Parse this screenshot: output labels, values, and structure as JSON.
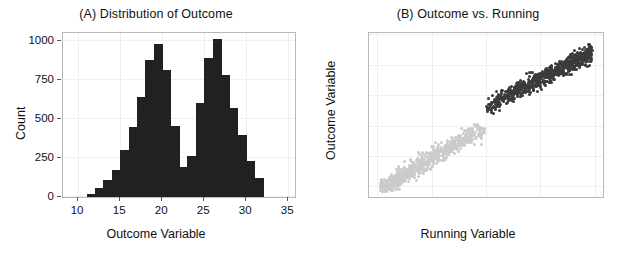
{
  "figure": {
    "background": "#ffffff",
    "width": 625,
    "height": 256
  },
  "panels": {
    "a": {
      "title": "(A) Distribution of Outcome",
      "xlabel": "Outcome Variable",
      "ylabel": "Count"
    },
    "b": {
      "title": "(B) Outcome vs. Running",
      "xlabel": "Running Variable",
      "ylabel": "Outcome Variable"
    }
  },
  "chart_data": [
    {
      "id": "panel-a",
      "type": "bar",
      "title": "(A) Distribution of Outcome",
      "xlabel": "Outcome Variable",
      "ylabel": "Count",
      "xlim": [
        8.2,
        35.8
      ],
      "ylim": [
        0,
        1050
      ],
      "xticks": [
        10,
        15,
        20,
        25,
        30,
        35
      ],
      "yticks": [
        0,
        250,
        500,
        750,
        1000
      ],
      "grid": true,
      "legend": "none",
      "bin_width": 1,
      "bar_color": "#212121",
      "description": "Bimodal histogram of outcome variable with modes near 19 and 25 and a sharp dip near 21-22",
      "bin_centers": [
        11.5,
        12.5,
        13.5,
        14.5,
        15.5,
        16.5,
        17.5,
        18.5,
        19.5,
        20.5,
        21.5,
        22.5,
        23.5,
        24.5,
        25.5,
        26.5,
        27.5,
        28.5,
        29.5,
        30.5,
        31.5
      ],
      "categories": [
        "11-12",
        "12-13",
        "13-14",
        "14-15",
        "15-16",
        "16-17",
        "17-18",
        "18-19",
        "19-20",
        "20-21",
        "21-22",
        "22-23",
        "23-24",
        "24-25",
        "25-26",
        "26-27",
        "27-28",
        "28-29",
        "29-30",
        "30-31",
        "31-32"
      ],
      "values": [
        20,
        60,
        110,
        175,
        300,
        450,
        640,
        880,
        980,
        815,
        455,
        195,
        260,
        600,
        890,
        1010,
        780,
        570,
        400,
        230,
        120
      ]
    },
    {
      "id": "panel-b",
      "type": "scatter",
      "title": "(B) Outcome vs. Running",
      "xlabel": "Running Variable",
      "ylabel": "Outcome Variable",
      "xlim": [
        -21.5,
        21.5
      ],
      "ylim": [
        8.4,
        35.4
      ],
      "xticks": [
        -20,
        -10,
        0,
        10,
        20
      ],
      "yticks": [
        10,
        15,
        20,
        25,
        30,
        35
      ],
      "grid": true,
      "legend": "none",
      "cutoff": 0,
      "discontinuity_jump": 3.0,
      "series": [
        {
          "name": "Below cutoff (control)",
          "color": "#cbcbcb",
          "x_range": [
            -19.5,
            -0.1
          ],
          "y_range": [
            9.2,
            20.4
          ],
          "slope": 0.55,
          "intercept": 20.2,
          "n_points": 700
        },
        {
          "name": "At or above cutoff (treated)",
          "color": "#3b3b3b",
          "x_range": [
            0.1,
            19.5
          ],
          "y_range": [
            19.8,
            33.7
          ],
          "slope": 0.46,
          "intercept": 23.2,
          "n_points": 700
        }
      ]
    }
  ]
}
